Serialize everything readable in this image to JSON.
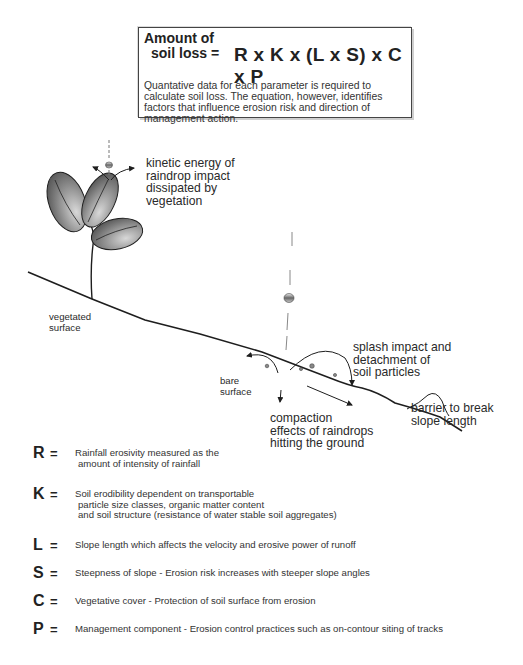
{
  "equation_box": {
    "label_line1": "Amount of",
    "label_line2": "soil loss  =",
    "formula": "R x K x (L x S) x C x P",
    "note": "Quantative data for each parameter is required to calculate soil loss.  The equation, however, identifies factors that influence erosion risk and direction of management action."
  },
  "annotations": {
    "kinetic": [
      "kinetic energy of",
      "raindrop impact",
      "dissipated by",
      "vegetation"
    ],
    "vegetated_surface": [
      "vegetated",
      "surface"
    ],
    "bare_surface": [
      "bare",
      "surface"
    ],
    "splash": [
      "splash impact and",
      "detachment of",
      "soil particles"
    ],
    "compaction": [
      "compaction",
      "effects of raindrops",
      "hitting the ground"
    ],
    "barrier": [
      "barrier to break",
      "slope length"
    ]
  },
  "legend": [
    {
      "key": "R",
      "lines": [
        "Rainfall erosivity measured as the",
        "amount of intensity of rainfall"
      ]
    },
    {
      "key": "K",
      "lines": [
        "Soil erodibility dependent on transportable",
        "particle size classes, organic matter content",
        "and soil structure (resistance of water stable soil aggregates)"
      ]
    },
    {
      "key": "L",
      "lines": [
        "Slope length which affects the velocity and erosive power of runoff"
      ]
    },
    {
      "key": "S",
      "lines": [
        "Steepness of slope - Erosion risk increases with steeper slope angles"
      ]
    },
    {
      "key": "C",
      "lines": [
        "Vegetative cover - Protection of soil surface from erosion"
      ]
    },
    {
      "key": "P",
      "lines": [
        "Management component - Erosion control practices such as on-contour siting of tracks"
      ]
    }
  ],
  "colors": {
    "line": "#1e1e1e",
    "leaf_dark": "#5a5a5a",
    "leaf_light": "#d8d8d8",
    "text": "#2a2a2a"
  }
}
